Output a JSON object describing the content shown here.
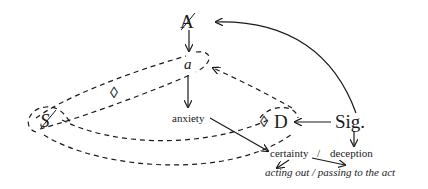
{
  "diagram": {
    "nodes": {
      "A": "A",
      "a": "a",
      "S": "S",
      "D": "D",
      "sig": "Sig.",
      "diamond_left": "◊",
      "diamond_D": "◊"
    },
    "labels": {
      "anxiety": "anxiety",
      "certainty": "certainty",
      "slash": "/",
      "deception": "deception",
      "acting_line": "acting out / passing to the act"
    },
    "edges": [
      {
        "from": "Sig.",
        "to": "A",
        "style": "solid-curve"
      },
      {
        "from": "A",
        "to": "a",
        "style": "solid"
      },
      {
        "from": "a",
        "to": "anxiety",
        "style": "solid"
      },
      {
        "from": "Sig.",
        "to": "D",
        "style": "solid"
      },
      {
        "from": "Sig.",
        "to": "deception",
        "style": "solid"
      },
      {
        "from": "anxiety",
        "to": "certainty",
        "style": "solid"
      },
      {
        "from": "D",
        "to": "a",
        "style": "dashed"
      },
      {
        "from": "certainty",
        "to": "acting out",
        "style": "solid"
      },
      {
        "from": "certainty",
        "to": "passing to the act",
        "style": "solid"
      }
    ],
    "colors": {
      "ink": "#1a1a1a",
      "background": "#ffffff"
    }
  }
}
